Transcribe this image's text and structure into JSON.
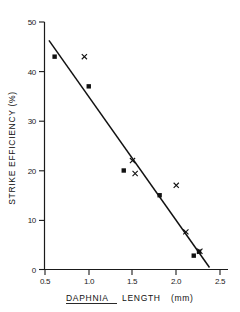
{
  "chart_data": {
    "type": "scatter",
    "title": "",
    "xlabel": "DAPHNIA LENGTH  (mm)",
    "xlabel_italic_part": "DAPHNIA",
    "xlabel_rest": "LENGTH",
    "xlabel_units": "(mm)",
    "ylabel": "STRIKE EFFICIENCY  (%)",
    "xlim": [
      0.5,
      2.5
    ],
    "ylim": [
      0,
      50
    ],
    "xticks": [
      0.5,
      1.0,
      1.5,
      2.0,
      2.5
    ],
    "xtick_labels": [
      "0.5",
      "1.0",
      "1.5",
      "2.0",
      "2.5"
    ],
    "yticks": [
      0,
      10,
      20,
      30,
      40,
      50
    ],
    "ytick_labels": [
      "0",
      "10",
      "20",
      "30",
      "40",
      "50"
    ],
    "grid": false,
    "legend": "none",
    "series": [
      {
        "name": "filled-square",
        "marker": "square",
        "points": [
          {
            "x": 0.61,
            "y": 43.0
          },
          {
            "x": 1.0,
            "y": 37.0
          },
          {
            "x": 1.4,
            "y": 20.0
          },
          {
            "x": 1.81,
            "y": 15.0
          },
          {
            "x": 2.2,
            "y": 2.8
          },
          {
            "x": 2.26,
            "y": 3.6
          }
        ]
      },
      {
        "name": "cross",
        "marker": "x",
        "points": [
          {
            "x": 0.95,
            "y": 43.0
          },
          {
            "x": 1.5,
            "y": 22.0
          },
          {
            "x": 1.53,
            "y": 19.4
          },
          {
            "x": 2.0,
            "y": 17.0
          },
          {
            "x": 2.11,
            "y": 7.6
          },
          {
            "x": 2.27,
            "y": 3.7
          }
        ]
      }
    ],
    "fit_line": {
      "name": "regression-line",
      "x1": 0.545,
      "y1": 46.3,
      "x2": 2.38,
      "y2": 0.4
    },
    "colors": {
      "axis": "#1a1a1a",
      "marker": "#111111",
      "line": "#111111",
      "background": "#ffffff"
    }
  }
}
